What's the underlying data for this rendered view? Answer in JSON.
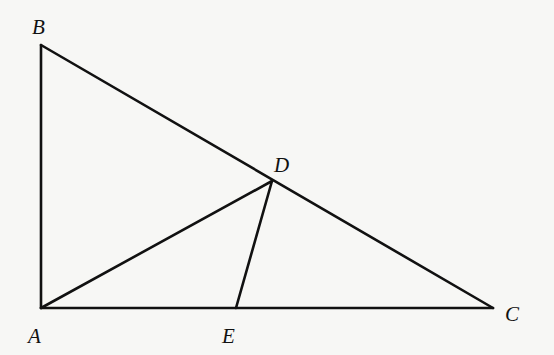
{
  "diagram": {
    "type": "geometry",
    "points": {
      "A": {
        "label": "A",
        "x": 41,
        "y": 308,
        "lx": 28,
        "ly": 343
      },
      "B": {
        "label": "B",
        "x": 41,
        "y": 45,
        "lx": 32,
        "ly": 34
      },
      "C": {
        "label": "C",
        "x": 493,
        "y": 308,
        "lx": 505,
        "ly": 321
      },
      "D": {
        "label": "D",
        "x": 272,
        "y": 181,
        "lx": 274,
        "ly": 172
      },
      "E": {
        "label": "E",
        "x": 236,
        "y": 308,
        "lx": 222,
        "ly": 343
      }
    },
    "segments": [
      {
        "name": "AB",
        "from": "A",
        "to": "B"
      },
      {
        "name": "BC",
        "from": "B",
        "to": "C"
      },
      {
        "name": "AC",
        "from": "A",
        "to": "C"
      },
      {
        "name": "AD",
        "from": "A",
        "to": "D"
      },
      {
        "name": "DE",
        "from": "D",
        "to": "E"
      }
    ],
    "colors": {
      "stroke": "#111111",
      "background": "#f7f7f5"
    }
  }
}
